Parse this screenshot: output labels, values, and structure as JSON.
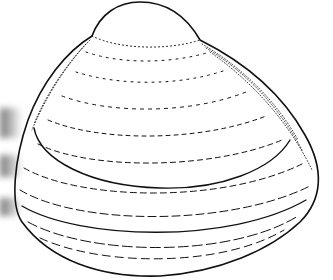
{
  "image": {
    "subject": "clam shell line drawing",
    "style": "black ink illustration on white",
    "colors": {
      "background": "#ffffff",
      "ink": "#111111",
      "smudge": "#6a6a6a"
    }
  }
}
